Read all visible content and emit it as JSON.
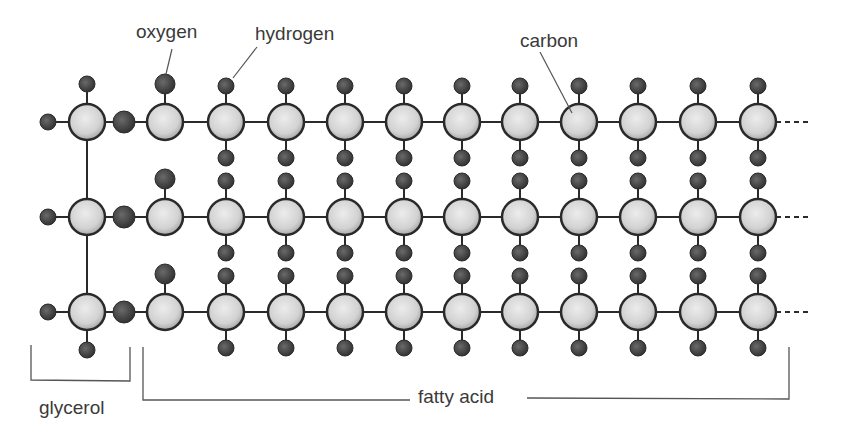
{
  "labels": {
    "oxygen": "oxygen",
    "hydrogen": "hydrogen",
    "carbon": "carbon",
    "glycerol": "glycerol",
    "fatty_acid": "fatty acid"
  },
  "colors": {
    "carbon_fill": "#d6d6d6",
    "carbon_stroke": "#2a2a2a",
    "hydrogen_fill": "#4a4a4a",
    "oxygen_fill": "#3c3c3c",
    "bond": "#2a2a2a",
    "text": "#3a3a3a"
  },
  "structure": {
    "rows_y": [
      122,
      217,
      312
    ],
    "glycerol_carbon_x": 87,
    "glycerol_left_hydrogen_x": 48,
    "ester_oxygen_x": 124,
    "carbonyl_carbon_x": 165,
    "chain_carbon_x": [
      226,
      286,
      345,
      404,
      462,
      520,
      579,
      638,
      698,
      758
    ],
    "chain_continues": true,
    "atoms_per_row": {
      "glycerol_carbon": 1,
      "ester_oxygen": 1,
      "carbonyl_oxygen": 1,
      "fatty_acid_carbons": 11
    }
  }
}
